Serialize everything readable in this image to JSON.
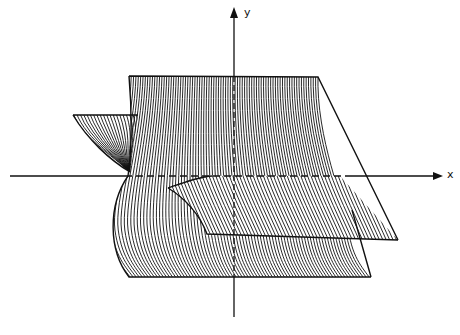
{
  "figure": {
    "type": "3d-surface-sketch",
    "axes": {
      "x_label": "x",
      "y_label": "y",
      "origin": [
        234,
        176
      ]
    },
    "colors": {
      "ink": "#111111",
      "background": "#ffffff"
    }
  }
}
